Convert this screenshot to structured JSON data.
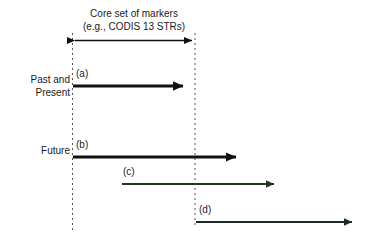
{
  "figure": {
    "title_line_1": "Core set of markers",
    "title_line_2": "(e.g., CODIS 13 STRs)",
    "row_labels": {
      "past_present_line_1": "Past and",
      "past_present_line_2": "Present",
      "future": "Future"
    },
    "arrows": [
      {
        "id": "a",
        "label": "(a)",
        "color": "#111111"
      },
      {
        "id": "b",
        "label": "(b)",
        "color": "#111111"
      },
      {
        "id": "c",
        "label": "(c)",
        "color": "#1d3a1d"
      },
      {
        "id": "d",
        "label": "(d)",
        "color": "#1e2a26"
      }
    ],
    "span_arrow": {
      "label": "",
      "color": "#111111"
    },
    "guide_lines": {
      "color": "#555555"
    },
    "background_color": "#ffffff"
  }
}
